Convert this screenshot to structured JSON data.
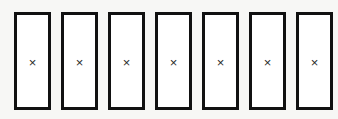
{
  "canvas": {
    "width": 338,
    "height": 119,
    "background_color": "#f7f7f5"
  },
  "style": {
    "box_border_color": "#111111",
    "box_fill_color": "#ffffff",
    "mark_color": "#2b2b2b",
    "box_border_width_px": 3,
    "box_width_px": 37,
    "box_height_px": 98,
    "box_gap_px": 10,
    "first_box_left_px": 14,
    "row_top_px": 12
  },
  "diagram": {
    "box_count": 7,
    "last_box_clipped": true,
    "boxes": [
      {
        "index": 1,
        "mark": "×",
        "clipped": false
      },
      {
        "index": 2,
        "mark": "×",
        "clipped": false
      },
      {
        "index": 3,
        "mark": "×",
        "clipped": false
      },
      {
        "index": 4,
        "mark": "×",
        "clipped": false
      },
      {
        "index": 5,
        "mark": "×",
        "clipped": false
      },
      {
        "index": 6,
        "mark": "×",
        "clipped": false
      },
      {
        "index": 7,
        "mark": "×",
        "clipped": true
      }
    ]
  }
}
